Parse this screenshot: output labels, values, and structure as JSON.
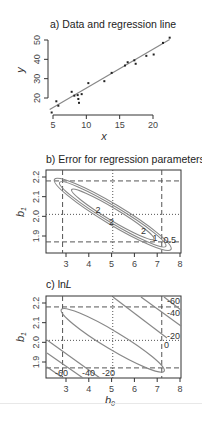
{
  "chart_data": [
    {
      "panel": "a",
      "type": "scatter",
      "title": "a) Data and regression line",
      "xlabel": "x",
      "ylabel": "y",
      "xticks": [
        5,
        10,
        15,
        20
      ],
      "yticks": [
        20,
        30,
        40,
        50
      ],
      "xlim": [
        4.5,
        22.5
      ],
      "ylim": [
        12,
        52
      ],
      "points": [
        [
          4.8,
          12.5
        ],
        [
          5.5,
          18.3
        ],
        [
          5.8,
          16.0
        ],
        [
          7.8,
          23.2
        ],
        [
          8.2,
          21.2
        ],
        [
          8.7,
          21.5
        ],
        [
          8.8,
          19.5
        ],
        [
          8.9,
          17.5
        ],
        [
          9.3,
          22.0
        ],
        [
          10.3,
          27.7
        ],
        [
          12.7,
          28.7
        ],
        [
          13.8,
          33.0
        ],
        [
          15.8,
          36.8
        ],
        [
          16.2,
          38.5
        ],
        [
          17.2,
          39.5
        ],
        [
          17.4,
          37.7
        ],
        [
          19.0,
          41.8
        ],
        [
          20.1,
          42.5
        ],
        [
          21.5,
          48.5
        ],
        [
          22.5,
          51.2
        ]
      ],
      "regression": {
        "intercept": 5.05,
        "slope": 2.01,
        "x_range": [
          4.5,
          22.5
        ]
      }
    },
    {
      "panel": "b",
      "type": "contour",
      "title": "b) Error for regression parameters",
      "xlabel": "b0",
      "ylabel": "b1",
      "xticks": [
        3,
        4,
        5,
        6,
        7,
        8
      ],
      "yticks": [
        1.9,
        2.0,
        2.1,
        2.2
      ],
      "xlim": [
        2.2,
        8.0
      ],
      "ylim": [
        1.82,
        2.23
      ],
      "contour_levels": [
        "0.5",
        "1",
        "2"
      ],
      "contour_label_positions": [
        {
          "label": "2",
          "b0": 4.4,
          "b1": 2.03
        },
        {
          "label": "2",
          "b0": 5.0,
          "b1": 1.97
        },
        {
          "label": "2",
          "b0": 6.4,
          "b1": 1.925
        },
        {
          "label": "1",
          "b0": 6.9,
          "b1": 1.89
        },
        {
          "label": "0.5",
          "b0": 7.55,
          "b1": 1.88
        }
      ],
      "reference_lines": {
        "dashed_b0": [
          2.85,
          7.2
        ],
        "dotted_b0": [
          5.05
        ],
        "dashed_b1": [
          2.18,
          1.87
        ],
        "dotted_b1": [
          2.01
        ]
      }
    },
    {
      "panel": "c",
      "type": "contour",
      "title": "c) lnL",
      "xlabel": "b0",
      "ylabel": "b1",
      "xticks": [
        3,
        4,
        5,
        6,
        7,
        8
      ],
      "yticks": [
        1.9,
        2.0,
        2.1,
        2.2
      ],
      "xlim": [
        2.2,
        8.0
      ],
      "ylim": [
        1.82,
        2.23
      ],
      "contour_levels": [
        "0",
        "-20",
        "-40",
        "-60"
      ],
      "contour_labels_right": [
        "-60",
        "-40",
        "-20"
      ],
      "contour_labels_bottom": [
        "-60",
        "-40",
        "-20"
      ],
      "contour_label_center": "0",
      "reference_lines": {
        "dashed_b0": [
          2.85,
          7.2
        ],
        "dotted_b0": [
          5.05
        ],
        "dashed_b1": [
          2.18,
          1.87
        ],
        "dotted_b1": [
          2.01
        ]
      }
    }
  ],
  "labels": {
    "a_title": "a) Data and regression line",
    "a_xlabel": "x",
    "a_ylabel": "y",
    "b_title": "b) Error for regression parameters",
    "b_ylabel": "b",
    "b_ylabel_sub": "1",
    "c_title_prefix": "c) ln",
    "c_title_italic": "L",
    "c_ylabel": "b",
    "c_ylabel_sub": "1",
    "c_xlabel": "b",
    "c_xlabel_sub": "0"
  },
  "colors": {
    "axis": "#333333",
    "line": "#888888",
    "points": "#222222",
    "ref": "#555555"
  }
}
